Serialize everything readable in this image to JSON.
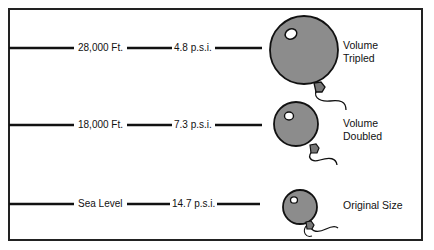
{
  "diagram": {
    "title": "",
    "rows": [
      {
        "altitude": "28,000 Ft.",
        "pressure": "4.8 p.s.i.",
        "description_line1": "Volume",
        "description_line2": "Tripled",
        "balloon": {
          "cx": 304,
          "cy": 50,
          "r": 34
        }
      },
      {
        "altitude": "18,000 Ft.",
        "pressure": "7.3 p.s.i.",
        "description_line1": "Volume",
        "description_line2": "Doubled",
        "balloon": {
          "cx": 296,
          "cy": 124,
          "r": 22
        }
      },
      {
        "altitude": "Sea Level",
        "pressure": "14.7 p.s.i.",
        "description_line1": "Original Size",
        "description_line2": "",
        "balloon": {
          "cx": 300,
          "cy": 206,
          "r": 17
        }
      }
    ],
    "colors": {
      "balloon_fill": "#8c8c8c",
      "line": "#111111",
      "border": "#222222"
    }
  }
}
